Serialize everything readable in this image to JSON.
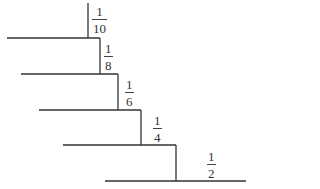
{
  "diagram": {
    "title": "",
    "steps": [
      {
        "label_num": "1",
        "label_den": "10",
        "riser": {
          "x": 88,
          "y1": 3,
          "y2": 38
        },
        "tread": {
          "y": 38,
          "x1": 7,
          "x2": 100
        },
        "label_pos": {
          "left": 92,
          "top": 5
        }
      },
      {
        "label_num": "1",
        "label_den": "8",
        "riser": {
          "x": 100,
          "y1": 38,
          "y2": 74
        },
        "tread": {
          "y": 74,
          "x1": 21,
          "x2": 118
        },
        "label_pos": {
          "left": 104,
          "top": 42
        }
      },
      {
        "label_num": "1",
        "label_den": "6",
        "riser": {
          "x": 118,
          "y1": 74,
          "y2": 110
        },
        "tread": {
          "y": 110,
          "x1": 39,
          "x2": 141
        },
        "label_pos": {
          "left": 125,
          "top": 78
        }
      },
      {
        "label_num": "1",
        "label_den": "4",
        "riser": {
          "x": 141,
          "y1": 110,
          "y2": 145
        },
        "tread": {
          "y": 145,
          "x1": 63,
          "x2": 176
        },
        "label_pos": {
          "left": 153,
          "top": 114
        }
      },
      {
        "label_num": "1",
        "label_den": "2",
        "riser": {
          "x": 176,
          "y1": 145,
          "y2": 181
        },
        "tread": {
          "y": 181,
          "x1": 105,
          "x2": 246
        },
        "label_pos": {
          "left": 207,
          "top": 150
        }
      }
    ],
    "line_color": "#333333"
  }
}
